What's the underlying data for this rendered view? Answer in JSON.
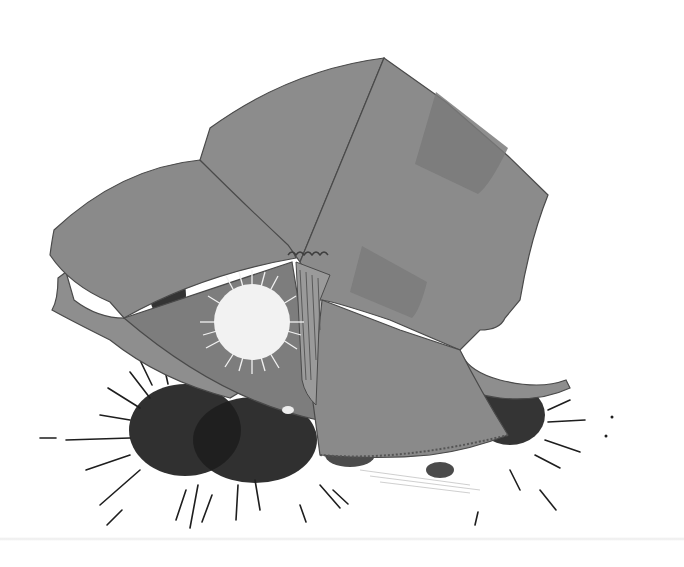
{
  "artwork": {
    "description": "Illustration of a cardboard-collage hat-like shape with a white starburst, striped fold, and black ink splatters beneath",
    "colors": {
      "background": "#ffffff",
      "cardboard": "#8a8a8a",
      "cardboard_dark": "#7c7c7c",
      "patch": "#777777",
      "ink": "#1e1e1e",
      "starburst": "#f2f2f2",
      "edge": "#4a4a4a"
    }
  }
}
